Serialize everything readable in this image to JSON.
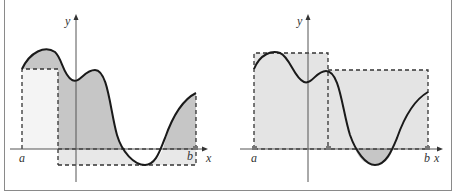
{
  "figure": {
    "left_panel": {
      "description": "Riemann sum with left endpoints and two subintervals; shaded area under curve",
      "labels": {
        "y_axis": "y",
        "x_axis": "x",
        "a": "a",
        "b": "b"
      }
    },
    "right_panel": {
      "description": "Riemann sum with two subintervals using midpoint-style rectangles over the curve",
      "labels": {
        "y_axis": "y",
        "x_axis": "x",
        "a": "a",
        "b": "b"
      }
    },
    "colors": {
      "curve": "#1a1a1a",
      "area_fill": "#c6c6c6",
      "rect_fill": "#e4e4e4",
      "dash": "#333333",
      "axis": "#555555",
      "frame": "#8a8a8a"
    }
  }
}
